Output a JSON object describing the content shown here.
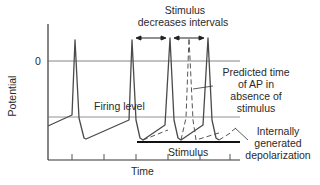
{
  "diagram": {
    "title_line1": "Stimulus",
    "title_line2": "decreases intervals",
    "axis": {
      "y_label": "Potential",
      "x_label": "Time",
      "zero_tick": "0"
    },
    "labels": {
      "firing_level": "Firing level",
      "predicted_line1": "Predicted time",
      "predicted_line2": "of AP in",
      "predicted_line3": "absence of",
      "predicted_line4": "stimulus",
      "internal_line1": "Internally",
      "internal_line2": "generated",
      "internal_line3": "depolarization",
      "stimulus": "Stimulus"
    },
    "colors": {
      "trace": "#4a4a4a",
      "axis": "#333333",
      "reference_line": "#777777",
      "stimulus_bar": "#111111"
    }
  }
}
